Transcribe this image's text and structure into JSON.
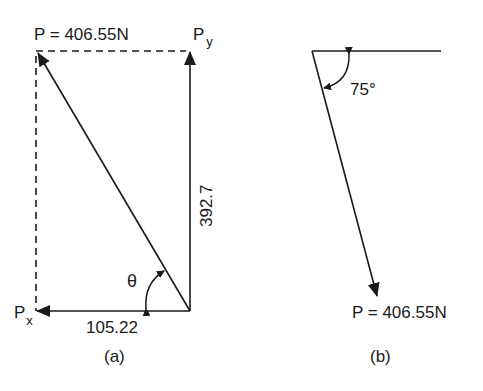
{
  "figure_a": {
    "caption": "(a)",
    "resultant_label": "P = 406.55N",
    "py_label_main": "P",
    "py_label_sub": "y",
    "px_label_main": "P",
    "px_label_sub": "x",
    "vertical_value": "392.7",
    "horizontal_value": "105.22",
    "angle_symbol": "θ"
  },
  "figure_b": {
    "caption": "(b)",
    "angle_label": "75°",
    "force_label": "P = 406.55N"
  },
  "colors": {
    "line": "#1a1a1a",
    "background": "#ffffff"
  }
}
